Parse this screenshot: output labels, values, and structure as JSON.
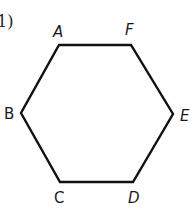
{
  "problem_number": "1)",
  "figure": {
    "shape": "hexagon",
    "stroke_color": "#111111",
    "vertices": [
      {
        "label": "A",
        "x": 59,
        "y": 45
      },
      {
        "label": "F",
        "x": 131,
        "y": 45
      },
      {
        "label": "E",
        "x": 173,
        "y": 114
      },
      {
        "label": "D",
        "x": 133,
        "y": 182
      },
      {
        "label": "C",
        "x": 60,
        "y": 182
      },
      {
        "label": "B",
        "x": 21,
        "y": 113
      }
    ]
  },
  "labels": {
    "A": "A",
    "F": "F",
    "E": "E",
    "D": "D",
    "C": "C",
    "B": "B"
  }
}
